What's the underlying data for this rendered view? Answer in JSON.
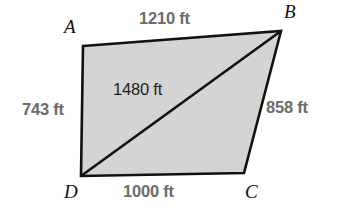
{
  "figure": {
    "type": "geometry-quadrilateral-with-diagonal",
    "shape_name": "quadrilateral ABCD",
    "fill_color": "#d4d4d4",
    "stroke_color": "#111111",
    "side_label_color": "#6b6b6b",
    "diagonal_label_color": "#1c1c1c",
    "background_color": "#ffffff",
    "vertices": [
      {
        "id": "A",
        "label": "A",
        "x": 83,
        "y": 46
      },
      {
        "id": "B",
        "label": "B",
        "x": 281,
        "y": 31
      },
      {
        "id": "C",
        "label": "C",
        "x": 244,
        "y": 173
      },
      {
        "id": "D",
        "label": "D",
        "x": 81,
        "y": 176
      }
    ],
    "sides": [
      {
        "id": "AB",
        "from": "A",
        "to": "B",
        "label": "1210 ft",
        "value": 1210,
        "unit": "ft",
        "position": "top"
      },
      {
        "id": "BC",
        "from": "B",
        "to": "C",
        "label": "858 ft",
        "value": 858,
        "unit": "ft",
        "position": "right"
      },
      {
        "id": "DC",
        "from": "D",
        "to": "C",
        "label": "1000 ft",
        "value": 1000,
        "unit": "ft",
        "position": "bottom"
      },
      {
        "id": "AD",
        "from": "A",
        "to": "D",
        "label": "743 ft",
        "value": 743,
        "unit": "ft",
        "position": "left"
      }
    ],
    "diagonal": {
      "id": "DB",
      "from": "D",
      "to": "B",
      "label": "1480 ft",
      "value": 1480,
      "unit": "ft"
    }
  }
}
